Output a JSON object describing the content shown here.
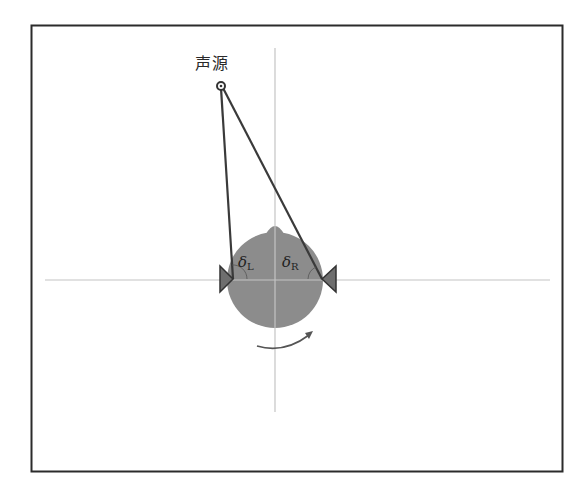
{
  "diagram": {
    "title": "",
    "source_label": "声源",
    "angle_left": {
      "symbol": "δ",
      "subscript": "L"
    },
    "angle_right": {
      "symbol": "δ",
      "subscript": "R"
    },
    "elements": {
      "frame": {
        "x": 31,
        "y": 25,
        "width": 531,
        "height": 446
      },
      "horizontal_axis": {
        "x1": 45,
        "y1": 280,
        "x2": 550,
        "y2": 280
      },
      "vertical_axis": {
        "x1": 275,
        "y1": 48,
        "x2": 275,
        "y2": 412
      },
      "head": {
        "cx": 275,
        "cy": 280,
        "r": 48,
        "fill": "#8a8a8a"
      },
      "source_point": {
        "cx": 221,
        "cy": 86,
        "r": 4
      },
      "left_ear": {
        "points": "220,266 220,292 233,279"
      },
      "right_ear": {
        "points": "336,266 336,292 322,279"
      },
      "rotation_arrow": {
        "direction": "clockwise-right"
      }
    },
    "colors": {
      "frame": "#2b2b2b",
      "axis": "#c8c8c8",
      "head_fill": "#8c8c8c",
      "ray": "#3a3a3a",
      "ear": "#6e6e6e"
    }
  }
}
